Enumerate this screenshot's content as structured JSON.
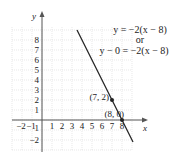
{
  "chart_data": {
    "type": "line",
    "title": "",
    "xlabel": "x",
    "ylabel": "y",
    "xlim": [
      -3,
      9
    ],
    "ylim": [
      -3,
      9
    ],
    "grid": true,
    "x_ticks": [
      "-2",
      "-1",
      "1",
      "2",
      "3",
      "4",
      "5",
      "6",
      "7",
      "8"
    ],
    "y_ticks": [
      "-2",
      "-1",
      "1",
      "2",
      "3",
      "4",
      "5",
      "6",
      "7",
      "8"
    ],
    "series": [
      {
        "name": "y = -2(x - 8)",
        "x": [
          3.5,
          9.1
        ],
        "y": [
          9,
          -2.2
        ],
        "color": "#222222"
      }
    ],
    "points": [
      {
        "label": "(7, 2)",
        "x": 7,
        "y": 2
      },
      {
        "label": "(8, 0)",
        "x": 8,
        "y": 0
      }
    ],
    "annotations": {
      "line1": "y = −2(x − 8)",
      "line2": "or",
      "line3": "y − 0 = −2(x − 8)"
    }
  }
}
